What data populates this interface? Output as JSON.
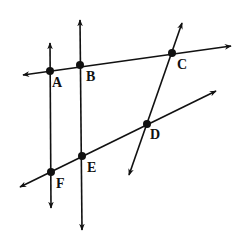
{
  "diagram": {
    "type": "geometry-lines",
    "stroke_color": "#111111",
    "background": "#ffffff",
    "points": {
      "A": {
        "label": "A",
        "x": 50,
        "y": 71
      },
      "B": {
        "label": "B",
        "x": 80,
        "y": 65
      },
      "C": {
        "label": "C",
        "x": 172,
        "y": 53
      },
      "D": {
        "label": "D",
        "x": 147,
        "y": 124
      },
      "E": {
        "label": "E",
        "x": 82,
        "y": 156
      },
      "F": {
        "label": "F",
        "x": 51,
        "y": 172
      }
    },
    "lines": [
      {
        "name": "line-AC",
        "through": [
          "A",
          "B",
          "C"
        ]
      },
      {
        "name": "line-FD",
        "through": [
          "F",
          "E",
          "D"
        ]
      },
      {
        "name": "line-AF",
        "through": [
          "A",
          "F"
        ]
      },
      {
        "name": "line-BE",
        "through": [
          "B",
          "E"
        ]
      },
      {
        "name": "line-CD",
        "through": [
          "C",
          "D"
        ]
      }
    ]
  }
}
